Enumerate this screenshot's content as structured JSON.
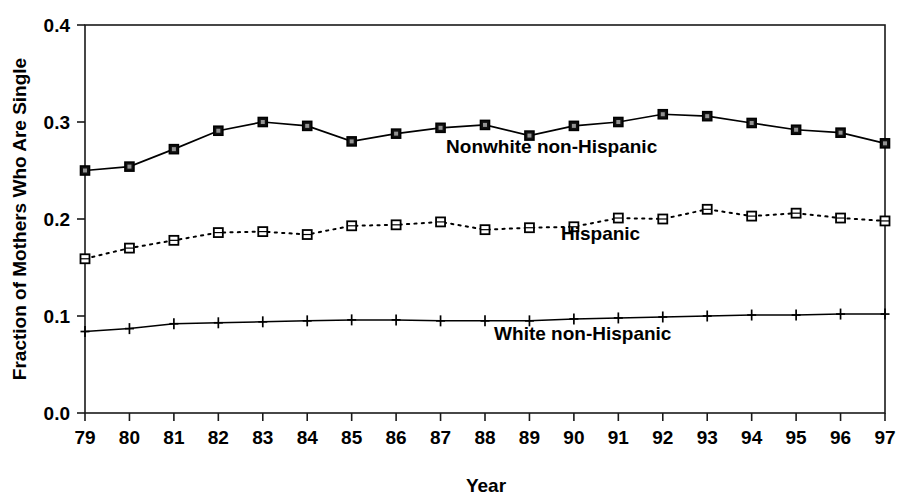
{
  "chart_data": {
    "type": "line",
    "title": "",
    "xlabel": "Year",
    "ylabel": "Fraction of Mothers Who Are Single",
    "x": [
      79,
      80,
      81,
      82,
      83,
      84,
      85,
      86,
      87,
      88,
      89,
      90,
      91,
      92,
      93,
      94,
      95,
      96,
      97
    ],
    "categories": [
      "79",
      "80",
      "81",
      "82",
      "83",
      "84",
      "85",
      "86",
      "87",
      "88",
      "89",
      "90",
      "91",
      "92",
      "93",
      "94",
      "95",
      "96",
      "97"
    ],
    "xtick_labels": [
      "79",
      "80",
      "81",
      "82",
      "83",
      "84",
      "85",
      "86",
      "87",
      "88",
      "89",
      "90",
      "91",
      "92",
      "93",
      "94",
      "95",
      "96",
      "97"
    ],
    "ytick_labels": [
      "0.0",
      "0.1",
      "0.2",
      "0.3",
      "0.4"
    ],
    "ytick_values": [
      0.0,
      0.1,
      0.2,
      0.3,
      0.4
    ],
    "ylim": [
      0.0,
      0.4
    ],
    "xlim": [
      79,
      97
    ],
    "grid": false,
    "legend_position": "inline-annotations",
    "series": [
      {
        "name": "Nonwhite non-Hispanic",
        "marker": "filled-square",
        "line_style": "solid",
        "annotation": "Nonwhite non-Hispanic",
        "annotation_x": 89.5,
        "annotation_y": 0.268,
        "values": [
          0.25,
          0.254,
          0.272,
          0.291,
          0.3,
          0.296,
          0.28,
          0.288,
          0.294,
          0.297,
          0.286,
          0.296,
          0.3,
          0.308,
          0.306,
          0.299,
          0.292,
          0.289,
          0.278
        ]
      },
      {
        "name": "Hispanic",
        "marker": "open-square",
        "line_style": "dotted",
        "annotation": "Hispanic",
        "annotation_x": 90.6,
        "annotation_y": 0.178,
        "values": [
          0.159,
          0.17,
          0.178,
          0.186,
          0.187,
          0.184,
          0.193,
          0.194,
          0.197,
          0.189,
          0.191,
          0.192,
          0.201,
          0.2,
          0.21,
          0.203,
          0.206,
          0.201,
          0.198
        ]
      },
      {
        "name": "White non-Hispanic",
        "marker": "plus",
        "line_style": "solid-thin",
        "annotation": "White non-Hispanic",
        "annotation_x": 90.2,
        "annotation_y": 0.075,
        "values": [
          0.084,
          0.087,
          0.092,
          0.093,
          0.094,
          0.095,
          0.096,
          0.096,
          0.095,
          0.095,
          0.095,
          0.097,
          0.098,
          0.099,
          0.1,
          0.101,
          0.101,
          0.102,
          0.102
        ]
      }
    ]
  },
  "colors": {
    "ink": "#000000",
    "background": "#ffffff"
  }
}
